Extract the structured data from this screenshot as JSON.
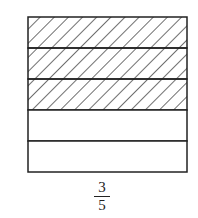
{
  "diagram": {
    "type": "fraction-area-model",
    "total_parts": 5,
    "shaded_parts": 3,
    "orientation": "horizontal-strips",
    "shading": "diagonal-hatch",
    "stroke_color": "#222222",
    "fill_color": "#ffffff"
  },
  "label": {
    "numerator": "3",
    "denominator": "5"
  }
}
